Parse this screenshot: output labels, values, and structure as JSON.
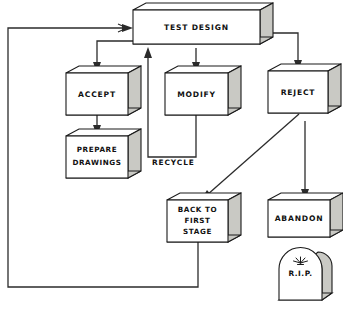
{
  "diagram": {
    "style": "isometric-3d-boxes",
    "colors": {
      "box_front": "#ffffff",
      "box_shade": "#c9c9c4",
      "outline": "#1a1a1a",
      "connector": "#2b2b2b",
      "background": "#ffffff"
    },
    "nodes": [
      {
        "id": "test-design",
        "label": "TEST DESIGN",
        "lines": [
          "TEST DESIGN"
        ],
        "shape": "box-3d"
      },
      {
        "id": "accept",
        "label": "ACCEPT",
        "lines": [
          "ACCEPT"
        ],
        "shape": "box-3d"
      },
      {
        "id": "modify",
        "label": "MODIFY",
        "lines": [
          "MODIFY"
        ],
        "shape": "box-3d"
      },
      {
        "id": "reject",
        "label": "REJECT",
        "lines": [
          "REJECT"
        ],
        "shape": "box-3d"
      },
      {
        "id": "prepare-drawings",
        "label": "PREPARE DRAWINGS",
        "lines": [
          "PREPARE",
          "DRAWINGS"
        ],
        "shape": "box-3d"
      },
      {
        "id": "back-to-first-stage",
        "label": "BACK TO FIRST STAGE",
        "lines": [
          "BACK TO",
          "FIRST",
          "STAGE"
        ],
        "shape": "box-3d"
      },
      {
        "id": "abandon",
        "label": "ABANDON",
        "lines": [
          "ABANDON"
        ],
        "shape": "box-3d"
      },
      {
        "id": "rip",
        "label": "R.I.P.",
        "lines": [
          "R.I.P."
        ],
        "shape": "tombstone"
      }
    ],
    "edge_labels": [
      {
        "id": "recycle",
        "label": "RECYCLE"
      }
    ],
    "edges": [
      {
        "from": "test-design",
        "to": "accept",
        "label": ""
      },
      {
        "from": "test-design",
        "to": "modify",
        "label": ""
      },
      {
        "from": "test-design",
        "to": "reject",
        "label": ""
      },
      {
        "from": "accept",
        "to": "prepare-drawings",
        "label": ""
      },
      {
        "from": "modify",
        "to": "test-design",
        "label": "RECYCLE"
      },
      {
        "from": "reject",
        "to": "back-to-first-stage",
        "label": ""
      },
      {
        "from": "reject",
        "to": "abandon",
        "label": ""
      },
      {
        "from": "abandon",
        "to": "rip",
        "label": ""
      },
      {
        "from": "back-to-first-stage",
        "to": "test-design",
        "label": ""
      }
    ]
  },
  "labels": {
    "test_design": "TEST DESIGN",
    "accept": "ACCEPT",
    "modify": "MODIFY",
    "reject": "REJECT",
    "prepare_1": "PREPARE",
    "prepare_2": "DRAWINGS",
    "back_1": "BACK TO",
    "back_2": "FIRST",
    "back_3": "STAGE",
    "abandon": "ABANDON",
    "rip": "R.I.P.",
    "recycle": "RECYCLE"
  }
}
